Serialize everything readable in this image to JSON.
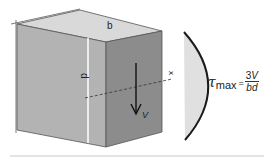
{
  "diagram": {
    "labels": {
      "width": "b",
      "depth": "d",
      "axis": "x",
      "shear_force": "V"
    },
    "formula": {
      "lhs_symbol": "τ",
      "lhs_subscript": "max",
      "equals": "=",
      "numerator_coeff": "3",
      "numerator_var": "V",
      "denominator": "bd"
    },
    "colors": {
      "top_face": "#d9d9d9",
      "front_face": "#b3b3b3",
      "side_face": "#8c8c8c",
      "stress_fill": "#e0e0e0",
      "stress_curve": "#1a1a1a",
      "outline": "#333333"
    }
  }
}
